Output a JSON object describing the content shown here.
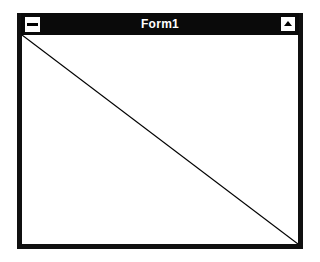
{
  "window": {
    "title": "Form1",
    "control_menu_icon": "control-menu-icon",
    "maximize_icon": "maximize-arrow-icon"
  },
  "client": {
    "background": "#ffffff",
    "line": {
      "from": "top-left",
      "to": "bottom-right",
      "color": "#000000"
    }
  },
  "colors": {
    "titlebar": "#0a0a0a",
    "frame": "#101010",
    "title_text": "#ffffff"
  }
}
